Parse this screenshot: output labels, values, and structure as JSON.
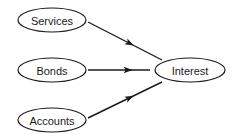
{
  "diagram": {
    "type": "directed-graph",
    "nodes": [
      {
        "id": "services",
        "label": "Services",
        "cx": 52,
        "cy": 20,
        "rx": 34,
        "ry": 12
      },
      {
        "id": "bonds",
        "label": "Bonds",
        "cx": 52,
        "cy": 70,
        "rx": 34,
        "ry": 12
      },
      {
        "id": "accounts",
        "label": "Accounts",
        "cx": 52,
        "cy": 120,
        "rx": 34,
        "ry": 12
      },
      {
        "id": "interest",
        "label": "Interest",
        "cx": 190,
        "cy": 70,
        "rx": 35,
        "ry": 12
      }
    ],
    "edges": [
      {
        "from": "services",
        "to": "interest",
        "x1": 88,
        "y1": 22,
        "x2": 162,
        "y2": 60,
        "head_t": 0.62
      },
      {
        "from": "bonds",
        "to": "interest",
        "x1": 88,
        "y1": 70,
        "x2": 150,
        "y2": 70,
        "head_t": 0.72
      },
      {
        "from": "accounts",
        "to": "interest",
        "x1": 88,
        "y1": 118,
        "x2": 162,
        "y2": 82,
        "head_t": 0.62
      }
    ],
    "colors": {
      "stroke": "#1a1a1a",
      "background": "#ffffff"
    }
  }
}
